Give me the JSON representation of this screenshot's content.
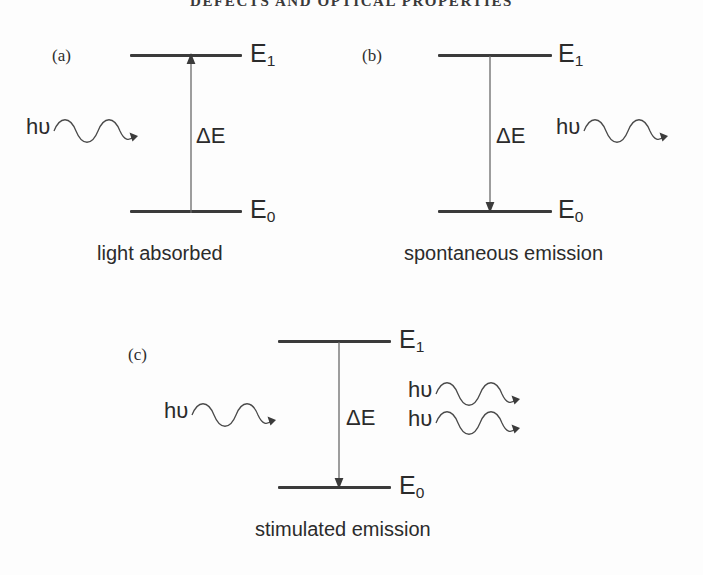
{
  "running_head": "DEFECTS AND OPTICAL PROPERTIES",
  "symbols": {
    "photon": "hυ",
    "delta_energy": "ΔE",
    "upper_level": "E",
    "upper_level_sub": "1",
    "lower_level": "E",
    "lower_level_sub": "0"
  },
  "colors": {
    "ink": "#2b2b2b",
    "level_line": "#3b3b3b",
    "arrow": "#5a5a5a",
    "wave": "#4a4a4a",
    "page_background": "#fdfdfd"
  },
  "panels": [
    {
      "id": "a",
      "letter": "(a)",
      "caption": "light absorbed",
      "upper_label": "E",
      "upper_sub": "1",
      "lower_label": "E",
      "lower_sub": "0",
      "delta_label": "ΔE",
      "transition_direction": "up",
      "photons_in": 1,
      "photons_out": 0,
      "photon_label": "hυ"
    },
    {
      "id": "b",
      "letter": "(b)",
      "caption": "spontaneous  emission",
      "upper_label": "E",
      "upper_sub": "1",
      "lower_label": "E",
      "lower_sub": "0",
      "delta_label": "ΔE",
      "transition_direction": "down",
      "photons_in": 0,
      "photons_out": 1,
      "photon_label": "hυ"
    },
    {
      "id": "c",
      "letter": "(c)",
      "caption": "stimulated emission",
      "upper_label": "E",
      "upper_sub": "1",
      "lower_label": "E",
      "lower_sub": "0",
      "delta_label": "ΔE",
      "transition_direction": "down",
      "photons_in": 1,
      "photons_out": 2,
      "photon_label": "hυ"
    }
  ]
}
